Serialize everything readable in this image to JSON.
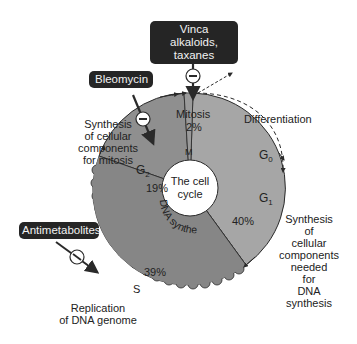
{
  "diagram": {
    "center_label": [
      "The cell",
      "cycle"
    ],
    "phases": [
      {
        "id": "M",
        "label": "M",
        "percent": "2%",
        "description": "Mitosis"
      },
      {
        "id": "G1",
        "label": "G",
        "sub": "1",
        "percent": "40%",
        "description": [
          "Synthesis",
          "of",
          "cellular",
          "components",
          "needed",
          "for",
          "DNA",
          "synthesis"
        ]
      },
      {
        "id": "S",
        "label": "S",
        "percent": "39%",
        "description": [
          "Replication",
          "of DNA genome"
        ],
        "arc_text": "DNA synthesis"
      },
      {
        "id": "G2",
        "label": "G",
        "sub": "2",
        "percent": "19%",
        "description": [
          "Synthesis",
          "of cellular",
          "components",
          "for mitosis"
        ]
      }
    ],
    "g0": {
      "label": "G",
      "sub": "0"
    },
    "differentiation_label": "Differentiation",
    "drugs": [
      {
        "name": "Vinca alkaloids, taxanes",
        "lines": [
          "Vinca alkaloids,",
          "taxanes"
        ],
        "target": "M",
        "effect": "inhibit"
      },
      {
        "name": "Bleomycin",
        "lines": [
          "Bleomycin"
        ],
        "target": "G2",
        "effect": "inhibit"
      },
      {
        "name": "Antimetabolites",
        "lines": [
          "Antimetabolites"
        ],
        "target": "S",
        "effect": "inhibit"
      }
    ],
    "inhibit_symbol": "−",
    "colors": {
      "g2": "#8f8f8f",
      "s": "#868686",
      "g1": "#a6a6a6",
      "m": "#9a9a9a",
      "drug_box": "#252525",
      "outline": "#2a2a2a"
    }
  }
}
